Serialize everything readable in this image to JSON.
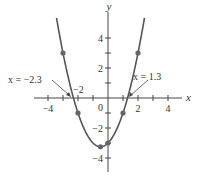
{
  "chart_data": {
    "type": "line",
    "title": "",
    "function": "y = x^2 + x - 3",
    "xlabel": "x",
    "ylabel": "y",
    "xlim": [
      -4.6,
      6.2
    ],
    "ylim": [
      -5,
      5.7
    ],
    "grid": false,
    "x_ticks": [
      -4,
      -3,
      -2,
      -1,
      1,
      2,
      3,
      4
    ],
    "x_tick_labels": [
      {
        "value": -4,
        "label": "−4"
      },
      {
        "value": 2,
        "label": "2"
      },
      {
        "value": 4,
        "label": "4"
      }
    ],
    "y_ticks": [
      -4,
      -3,
      -2,
      -1,
      1,
      2,
      3,
      4
    ],
    "y_tick_labels": [
      {
        "value": 4,
        "label": "4"
      },
      {
        "value": 2,
        "label": "2"
      },
      {
        "value": -2,
        "label": "−2"
      },
      {
        "value": -4,
        "label": "−4"
      }
    ],
    "origin_label": "0",
    "points": [
      {
        "x": -3,
        "y": 3
      },
      {
        "x": -2,
        "y": -1
      },
      {
        "x": -0.5,
        "y": -3.25
      },
      {
        "x": 0,
        "y": -3
      },
      {
        "x": 1,
        "y": -1
      },
      {
        "x": 2,
        "y": 3
      }
    ],
    "annotations": [
      {
        "text": "x = −2.3",
        "target": {
          "x": -2.3,
          "y": 0
        }
      },
      {
        "text": "x = 1.3",
        "target": {
          "x": 1.3,
          "y": 0
        }
      },
      {
        "text": "−2",
        "note": "tick label near left root"
      }
    ],
    "series": [
      {
        "name": "parabola",
        "color": "#555555"
      }
    ]
  }
}
